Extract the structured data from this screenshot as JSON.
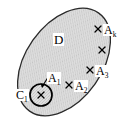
{
  "figure": {
    "background_color": "#ffffff",
    "region": {
      "name": "D",
      "label": "D",
      "shape": "ellipse",
      "fill_color": "#d9d9d9",
      "stroke_color": "#1a1a1a",
      "center": [
        64,
        62
      ],
      "radii": [
        60,
        38
      ],
      "rotation_deg": -55
    },
    "subregion": {
      "name": "C1",
      "label_base": "C",
      "label_sub": "1",
      "shape": "circle",
      "center": [
        41,
        95
      ],
      "radius": 11,
      "fill_color": "#d9d9d9",
      "stroke_color": "#000000"
    },
    "points": [
      {
        "id": "p1",
        "marker": "x",
        "cx": 41,
        "cy": 95,
        "label_base": "A",
        "label_sub": "1",
        "labelled": true,
        "has_leader": true
      },
      {
        "id": "p2",
        "marker": "x",
        "cx": 69,
        "cy": 85,
        "label_base": "A",
        "label_sub": "2",
        "labelled": true,
        "has_leader": false
      },
      {
        "id": "p3",
        "marker": "x",
        "cx": 90,
        "cy": 70,
        "label_base": "A",
        "label_sub": "3",
        "labelled": true,
        "has_leader": false
      },
      {
        "id": "p4",
        "marker": "x",
        "cx": 102,
        "cy": 50,
        "label_base": "",
        "label_sub": "",
        "labelled": false,
        "has_leader": false
      },
      {
        "id": "p5",
        "marker": "x",
        "cx": 98,
        "cy": 29,
        "label_base": "A",
        "label_sub": "k",
        "labelled": true,
        "has_leader": false
      }
    ],
    "leader_line": {
      "name": "a1-leader",
      "from": [
        50,
        74
      ],
      "to": [
        42,
        87
      ]
    }
  }
}
